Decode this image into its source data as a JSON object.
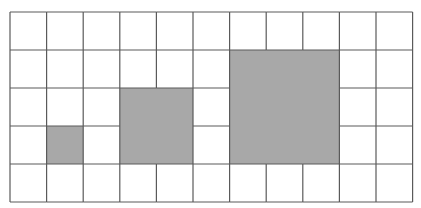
{
  "diagram": {
    "type": "grid-squares",
    "grid": {
      "columns": 11,
      "rows": 5,
      "origin_px": [
        10,
        12
      ],
      "cell_width_px": 36.6,
      "cell_height_px": 38,
      "line_color": "#5a5a5a",
      "background": "#ffffff"
    },
    "shaded_squares": [
      {
        "name": "small-square",
        "col": 1,
        "row": 3,
        "size": 1,
        "fill": "#a8a8a8"
      },
      {
        "name": "medium-square",
        "col": 3,
        "row": 2,
        "size": 2,
        "fill": "#a8a8a8"
      },
      {
        "name": "large-square",
        "col": 6,
        "row": 1,
        "size": 3,
        "fill": "#a8a8a8"
      }
    ],
    "top_text_fragments": [
      {
        "x": 20,
        "text": ","
      },
      {
        "x": 213,
        "text": "˘"
      }
    ]
  }
}
